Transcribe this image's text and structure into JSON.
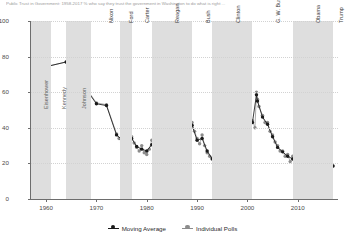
{
  "title_strip": "Public Trust in Government: 1958-2017  %  who say they trust the government in Washington to do what is right ...",
  "chart_data": {
    "type": "line",
    "title": "Public Trust in Government: 1958-2017",
    "xlabel": "",
    "ylabel": "",
    "xlim": [
      1957,
      2018
    ],
    "ylim": [
      0,
      100
    ],
    "grid": true,
    "legend_position": "bottom-center",
    "yticks": [
      0,
      20,
      40,
      60,
      80,
      100
    ],
    "xticks": [
      1960,
      1970,
      1980,
      1990,
      2000,
      2010
    ],
    "colors": {
      "moving_average": "#1a1a1a",
      "individual_polls": "#8c8c8c",
      "band": "#dedede",
      "grid": "#d2d2d2",
      "axis": "#6d6d6d"
    },
    "series": [
      {
        "name": "Moving Average",
        "marker": "circle",
        "color": "#1a1a1a",
        "points": [
          [
            1958.0,
            73.0
          ],
          [
            1964.0,
            77.0
          ],
          [
            1966.0,
            65.0
          ],
          [
            1968.0,
            61.5
          ],
          [
            1970.0,
            53.5
          ],
          [
            1972.0,
            52.5
          ],
          [
            1974.0,
            36.0
          ],
          [
            1975.0,
            33.5
          ],
          [
            1976.0,
            33.0
          ],
          [
            1977.0,
            34.0
          ],
          [
            1978.0,
            29.5
          ],
          [
            1979.0,
            28.0
          ],
          [
            1980.0,
            27.0
          ],
          [
            1981.0,
            30.5
          ],
          [
            1982.0,
            32.0
          ],
          [
            1983.0,
            37.0
          ],
          [
            1984.0,
            44.0
          ],
          [
            1985.0,
            43.0
          ],
          [
            1986.0,
            41.5
          ],
          [
            1987.0,
            40.5
          ],
          [
            1988.0,
            40.5
          ],
          [
            1989.0,
            41.5
          ],
          [
            1990.0,
            33.0
          ],
          [
            1991.0,
            34.0
          ],
          [
            1992.0,
            27.0
          ],
          [
            1993.0,
            22.5
          ],
          [
            1994.0,
            21.0
          ],
          [
            1995.0,
            22.0
          ],
          [
            1996.0,
            27.0
          ],
          [
            1997.0,
            32.0
          ],
          [
            1998.0,
            33.5
          ],
          [
            1999.0,
            36.0
          ],
          [
            2000.0,
            42.0
          ],
          [
            2001.0,
            43.0
          ],
          [
            2001.8,
            58.5
          ],
          [
            2002.0,
            55.0
          ],
          [
            2003.0,
            46.0
          ],
          [
            2004.0,
            42.0
          ],
          [
            2005.0,
            35.0
          ],
          [
            2006.0,
            29.0
          ],
          [
            2007.0,
            26.5
          ],
          [
            2008.0,
            24.0
          ],
          [
            2009.0,
            22.5
          ],
          [
            2010.0,
            22.0
          ],
          [
            2011.0,
            19.5
          ],
          [
            2012.0,
            22.5
          ],
          [
            2013.0,
            19.0
          ],
          [
            2014.0,
            21.0
          ],
          [
            2015.0,
            19.5
          ],
          [
            2016.0,
            19.0
          ],
          [
            2017.0,
            18.5
          ]
        ]
      },
      {
        "name": "Individual Polls",
        "marker": "circle",
        "color": "#8c8c8c",
        "points": [
          [
            1958.0,
            73.0
          ],
          [
            1964.0,
            77.0
          ],
          [
            1966.0,
            65.0
          ],
          [
            1968.0,
            62.0
          ],
          [
            1970.0,
            54.0
          ],
          [
            1972.0,
            53.0
          ],
          [
            1974.0,
            36.5
          ],
          [
            1974.5,
            34.0
          ],
          [
            1975.0,
            32.0
          ],
          [
            1975.5,
            35.0
          ],
          [
            1976.0,
            33.0
          ],
          [
            1976.5,
            31.0
          ],
          [
            1977.0,
            35.0
          ],
          [
            1977.5,
            31.5
          ],
          [
            1978.0,
            29.0
          ],
          [
            1978.5,
            27.0
          ],
          [
            1979.0,
            30.0
          ],
          [
            1979.5,
            26.0
          ],
          [
            1980.0,
            25.0
          ],
          [
            1980.5,
            28.0
          ],
          [
            1981.0,
            33.0
          ],
          [
            1981.5,
            29.0
          ],
          [
            1982.0,
            31.0
          ],
          [
            1982.5,
            34.0
          ],
          [
            1983.0,
            37.5
          ],
          [
            1983.5,
            40.0
          ],
          [
            1984.0,
            45.0
          ],
          [
            1984.5,
            42.0
          ],
          [
            1985.0,
            44.0
          ],
          [
            1985.5,
            40.0
          ],
          [
            1986.0,
            43.0
          ],
          [
            1986.5,
            39.0
          ],
          [
            1987.0,
            42.0
          ],
          [
            1987.5,
            38.0
          ],
          [
            1988.0,
            42.0
          ],
          [
            1988.5,
            39.0
          ],
          [
            1989.0,
            43.0
          ],
          [
            1989.5,
            38.0
          ],
          [
            1990.0,
            34.0
          ],
          [
            1990.5,
            31.0
          ],
          [
            1991.0,
            36.0
          ],
          [
            1991.5,
            30.0
          ],
          [
            1992.0,
            26.0
          ],
          [
            1992.5,
            24.0
          ],
          [
            1993.0,
            23.0
          ],
          [
            1993.5,
            20.0
          ],
          [
            1994.0,
            21.0
          ],
          [
            1994.5,
            19.0
          ],
          [
            1995.0,
            23.0
          ],
          [
            1995.5,
            20.0
          ],
          [
            1996.0,
            28.0
          ],
          [
            1996.5,
            25.0
          ],
          [
            1997.0,
            33.0
          ],
          [
            1997.5,
            30.0
          ],
          [
            1998.0,
            35.0
          ],
          [
            1998.5,
            31.0
          ],
          [
            1999.0,
            37.0
          ],
          [
            1999.5,
            33.0
          ],
          [
            2000.0,
            43.0
          ],
          [
            2000.5,
            39.0
          ],
          [
            2001.0,
            44.0
          ],
          [
            2001.5,
            40.0
          ],
          [
            2001.8,
            60.0
          ],
          [
            2002.0,
            56.0
          ],
          [
            2002.3,
            52.0
          ],
          [
            2003.0,
            47.0
          ],
          [
            2003.5,
            43.0
          ],
          [
            2004.0,
            43.0
          ],
          [
            2004.5,
            38.0
          ],
          [
            2005.0,
            36.0
          ],
          [
            2005.5,
            32.0
          ],
          [
            2006.0,
            30.0
          ],
          [
            2006.5,
            27.0
          ],
          [
            2007.0,
            27.0
          ],
          [
            2007.5,
            24.0
          ],
          [
            2008.0,
            25.0
          ],
          [
            2008.5,
            21.0
          ],
          [
            2009.0,
            24.0
          ],
          [
            2009.5,
            20.0
          ],
          [
            2010.0,
            23.0
          ],
          [
            2010.5,
            19.0
          ],
          [
            2011.0,
            20.0
          ],
          [
            2011.5,
            15.0
          ],
          [
            2012.0,
            24.0
          ],
          [
            2012.5,
            20.0
          ],
          [
            2013.0,
            19.0
          ],
          [
            2013.5,
            16.0
          ],
          [
            2014.0,
            22.0
          ],
          [
            2014.5,
            19.0
          ],
          [
            2015.0,
            20.0
          ],
          [
            2015.5,
            18.0
          ],
          [
            2016.0,
            19.0
          ],
          [
            2016.5,
            18.0
          ],
          [
            2017.0,
            18.5
          ]
        ]
      }
    ],
    "presidential_bands": [
      {
        "label": "Eisenhower",
        "start": 1957.0,
        "end": 1961.0,
        "shaded": true,
        "label_anchor": "bottom"
      },
      {
        "label": "Kennedy",
        "start": 1961.0,
        "end": 1963.9,
        "shaded": false,
        "label_anchor": "bottom"
      },
      {
        "label": "Johnson",
        "start": 1963.9,
        "end": 1969.0,
        "shaded": true,
        "label_anchor": "bottom"
      },
      {
        "label": "Nixon",
        "start": 1969.0,
        "end": 1974.6,
        "shaded": false,
        "label_anchor": "top"
      },
      {
        "label": "Ford",
        "start": 1974.6,
        "end": 1977.0,
        "shaded": true,
        "label_anchor": "top"
      },
      {
        "label": "Carter",
        "start": 1977.0,
        "end": 1981.0,
        "shaded": false,
        "label_anchor": "top"
      },
      {
        "label": "Reagan",
        "start": 1981.0,
        "end": 1989.0,
        "shaded": true,
        "label_anchor": "top"
      },
      {
        "label": "Bush",
        "start": 1989.0,
        "end": 1993.0,
        "shaded": false,
        "label_anchor": "top"
      },
      {
        "label": "Clinton",
        "start": 1993.0,
        "end": 2001.0,
        "shaded": true,
        "label_anchor": "top"
      },
      {
        "label": "G. W. Bush",
        "start": 2001.0,
        "end": 2009.0,
        "shaded": false,
        "label_anchor": "top"
      },
      {
        "label": "Obama",
        "start": 2009.0,
        "end": 2017.0,
        "shaded": true,
        "label_anchor": "top"
      },
      {
        "label": "Trump",
        "start": 2017.0,
        "end": 2018.0,
        "shaded": false,
        "label_anchor": "top"
      }
    ],
    "legend": [
      {
        "label": "Moving Average",
        "color": "#1a1a1a"
      },
      {
        "label": "Individual Polls",
        "color": "#8c8c8c"
      }
    ]
  }
}
